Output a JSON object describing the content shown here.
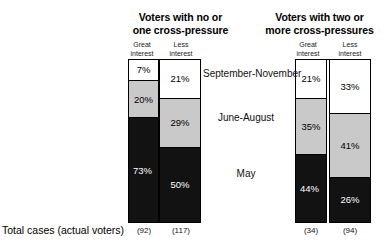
{
  "figure": {
    "footer_label": "Total cases (actual voters)",
    "column_headers": {
      "great_line1": "Great",
      "great_line2": "interest",
      "less_line1": "Less",
      "less_line2": "interest"
    },
    "periods": [
      "September-November",
      "June-August",
      "May"
    ],
    "colors": {
      "september_november": "#ffffff",
      "june_august": "#c9c9c9",
      "may": "#121212",
      "outline": "#000000"
    }
  },
  "groups": [
    {
      "title_line1": "Voters with no or",
      "title_line2": "one cross-pressure",
      "columns": [
        {
          "header_line1": "Great",
          "header_line2": "interest",
          "total_cases": "(92)",
          "segments": [
            {
              "period": "September-November",
              "label": "7%",
              "value": 7,
              "shade": "white"
            },
            {
              "period": "June-August",
              "label": "20%",
              "value": 20,
              "shade": "gray"
            },
            {
              "period": "May",
              "label": "73%",
              "value": 73,
              "shade": "black"
            }
          ]
        },
        {
          "header_line1": "Less",
          "header_line2": "interest",
          "total_cases": "(117)",
          "segments": [
            {
              "period": "September-November",
              "label": "21%",
              "value": 21,
              "shade": "white"
            },
            {
              "period": "June-August",
              "label": "29%",
              "value": 29,
              "shade": "gray"
            },
            {
              "period": "May",
              "label": "50%",
              "value": 50,
              "shade": "black"
            }
          ]
        }
      ]
    },
    {
      "title_line1": "Voters with two or",
      "title_line2": "more cross-pressures",
      "columns": [
        {
          "header_line1": "Great",
          "header_line2": "interest",
          "total_cases": "(34)",
          "segments": [
            {
              "period": "September-November",
              "label": "21%",
              "value": 21,
              "shade": "white"
            },
            {
              "period": "June-August",
              "label": "35%",
              "value": 35,
              "shade": "gray"
            },
            {
              "period": "May",
              "label": "44%",
              "value": 44,
              "shade": "black"
            }
          ]
        },
        {
          "header_line1": "Less",
          "header_line2": "interest",
          "total_cases": "(94)",
          "segments": [
            {
              "period": "September-November",
              "label": "33%",
              "value": 33,
              "shade": "white"
            },
            {
              "period": "June-August",
              "label": "41%",
              "value": 41,
              "shade": "gray"
            },
            {
              "period": "May",
              "label": "26%",
              "value": 26,
              "shade": "black"
            }
          ]
        }
      ]
    }
  ],
  "chart_data": {
    "type": "bar",
    "subtitle": "",
    "xlabel": "",
    "ylabel": "Percent",
    "ylim": [
      0,
      100
    ],
    "grid": false,
    "legend_position": "none",
    "orientation": "vertical-stacked",
    "stacked": true,
    "categories": [
      "No/one cross-pressure – Great interest",
      "No/one cross-pressure – Less interest",
      "Two or more cross-pressures – Great interest",
      "Two or more cross-pressures – Less interest"
    ],
    "series": [
      {
        "name": "September-November",
        "values": [
          7,
          21,
          21,
          33
        ]
      },
      {
        "name": "June-August",
        "values": [
          20,
          29,
          35,
          41
        ]
      },
      {
        "name": "May",
        "values": [
          73,
          50,
          44,
          26
        ]
      }
    ],
    "totals": [
      92,
      117,
      34,
      94
    ],
    "totals_label": "Total cases (actual voters)",
    "annotations": [
      "7%",
      "20%",
      "73%",
      "21%",
      "29%",
      "50%",
      "21%",
      "35%",
      "44%",
      "33%",
      "41%",
      "26%"
    ]
  }
}
